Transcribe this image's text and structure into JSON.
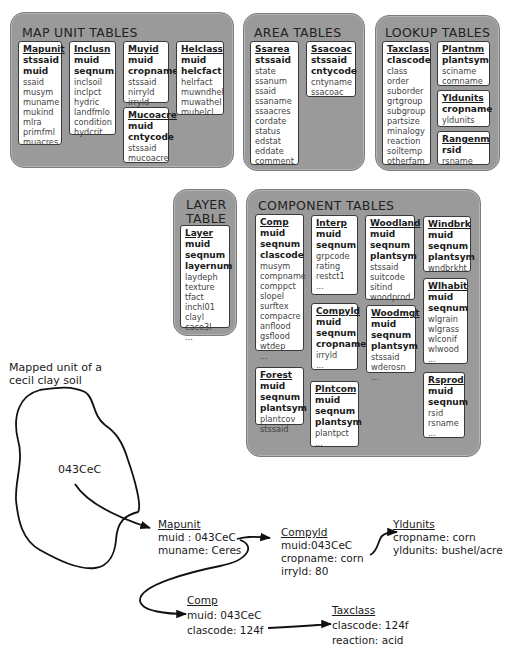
{
  "groups": {
    "map_unit": {
      "title": "MAP UNIT TABLES",
      "tables": {
        "mapunit": {
          "name": "Mapunit",
          "keys": [
            "stssaid",
            "muid"
          ],
          "fields": [
            "ssaid",
            "musym",
            "muname",
            "mukind",
            "mlra",
            "primfml",
            "muacres"
          ]
        },
        "inclusn": {
          "name": "Inclusn",
          "keys": [
            "muid",
            "seqnum"
          ],
          "fields": [
            "inclsoil",
            "inclpct",
            "hydric",
            "landfmlo",
            "condition",
            "hydcrit"
          ]
        },
        "muyid": {
          "name": "Muyid",
          "keys": [
            "muid",
            "cropname"
          ],
          "fields": [
            "stssaid",
            "nirryld",
            "irryld"
          ]
        },
        "mucoacre": {
          "name": "Mucoacre",
          "keys": [
            "muid",
            "cntycode"
          ],
          "fields": [
            "stssaid",
            "mucoacre"
          ]
        },
        "helclass": {
          "name": "Helclass",
          "keys": [
            "muid",
            "helcfact"
          ],
          "fields": [
            "helrfact",
            "muwndhel",
            "muwathel",
            "muhelcl"
          ]
        }
      }
    },
    "area": {
      "title": "AREA TABLES",
      "tables": {
        "ssarea": {
          "name": "Ssarea",
          "keys": [
            "stssaid"
          ],
          "fields": [
            "state",
            "ssanum",
            "ssaid",
            "ssaname",
            "ssaacres",
            "cordate",
            "status",
            "edstat",
            "eddate",
            "comment"
          ]
        },
        "ssacoac": {
          "name": "Ssacoac",
          "keys": [
            "stssaid",
            "cntycode"
          ],
          "fields": [
            "cntyname",
            "ssacoac"
          ]
        }
      }
    },
    "lookup": {
      "title": "LOOKUP TABLES",
      "tables": {
        "taxclass": {
          "name": "Taxclass",
          "keys": [
            "clascode"
          ],
          "fields": [
            "class",
            "order",
            "suborder",
            "grtgroup",
            "subgroup",
            "partsize",
            "minalogy",
            "reaction",
            "soiltemp",
            "otherfam"
          ]
        },
        "plantnm": {
          "name": "Plantnm",
          "keys": [
            "plantsym"
          ],
          "fields": [
            "sciname",
            "comname"
          ]
        },
        "yldunits": {
          "name": "Yldunits",
          "keys": [
            "cropname"
          ],
          "fields": [
            "yldunits"
          ]
        },
        "rangenm": {
          "name": "Rangenm",
          "keys": [
            "rsid"
          ],
          "fields": [
            "rsname"
          ]
        }
      }
    },
    "layer": {
      "title_line1": "LAYER",
      "title_line2": "TABLE",
      "tables": {
        "layer": {
          "name": "Layer",
          "keys": [
            "muid",
            "seqnum",
            "layernum"
          ],
          "fields": [
            "laydeph",
            "texture",
            "tfact",
            "inchl01",
            "clayl",
            "caco3l",
            "..."
          ]
        }
      }
    },
    "component": {
      "title": "COMPONENT TABLES",
      "tables": {
        "comp": {
          "name": "Comp",
          "keys": [
            "muid",
            "seqnum",
            "clascode"
          ],
          "fields": [
            "musym",
            "compname",
            "comppct",
            "slopel",
            "surftex",
            "compacre",
            "anflood",
            "gsflood",
            "wtdep",
            "..."
          ]
        },
        "interp": {
          "name": "Interp",
          "keys": [
            "muid",
            "seqnum"
          ],
          "fields": [
            "grpcode",
            "rating",
            "restct1",
            "..."
          ]
        },
        "compyld": {
          "name": "Compyld",
          "keys": [
            "muid",
            "seqnum",
            "cropname"
          ],
          "fields": [
            "irryld",
            "..."
          ]
        },
        "woodland": {
          "name": "Woodland",
          "keys": [
            "muid",
            "seqnum",
            "plantsym"
          ],
          "fields": [
            "stssaid",
            "suitcode",
            "sitind",
            "woodprod"
          ]
        },
        "woodmgt": {
          "name": "Woodmgt",
          "keys": [
            "muid",
            "seqnum",
            "plantsym"
          ],
          "fields": [
            "stssaid",
            "wderosn",
            "..."
          ]
        },
        "windbrk": {
          "name": "Windbrk",
          "keys": [
            "muid",
            "seqnum",
            "plantsym"
          ],
          "fields": [
            "wndbrkht"
          ]
        },
        "wlhabit": {
          "name": "Wlhabit",
          "keys": [
            "muid",
            "seqnum"
          ],
          "fields": [
            "wlgrain",
            "wlgrass",
            "wlconif",
            "wlwood",
            "..."
          ]
        },
        "forest": {
          "name": "Forest",
          "keys": [
            "muid",
            "seqnum",
            "plantsym"
          ],
          "fields": [
            "plantcov",
            "stssaid"
          ]
        },
        "plntcom": {
          "name": "Plntcom",
          "keys": [
            "muid",
            "seqnum",
            "plantsym"
          ],
          "fields": [
            "plantpct",
            "..."
          ]
        },
        "rsprod": {
          "name": "Rsprod",
          "keys": [
            "muid",
            "seqnum"
          ],
          "fields": [
            "rsid",
            "rsname",
            "..."
          ]
        }
      }
    }
  },
  "example": {
    "caption_line1": "Mapped unit of a",
    "caption_line2": "cecil clay soil",
    "polygon_label": "043CeC",
    "mapunit": {
      "title": "Mapunit",
      "line1": "muid : 043CeC",
      "line2": "muname: Ceres"
    },
    "compyld": {
      "title": "Compyld",
      "line1": "muid:043CeC",
      "line2": "cropname: corn",
      "line3": "irryld: 80"
    },
    "yldunits": {
      "title": "Yldunits",
      "line1": "cropname: corn",
      "line2": "yldunits: bushel/acre"
    },
    "comp": {
      "title": "Comp",
      "line1": "muid: 043CeC",
      "line2": "clascode: 124f"
    },
    "taxclass": {
      "title": "Taxclass",
      "line1": "clascode: 124f",
      "line2": "reaction: acid"
    }
  },
  "colors": {
    "group_fill": "#9a9a9a",
    "table_fill": "#ffffff",
    "stroke": "#1a1a1a"
  }
}
